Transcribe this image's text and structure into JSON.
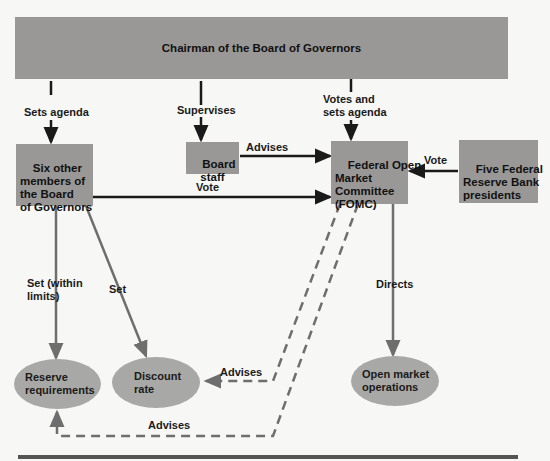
{
  "diagram": {
    "nodes": {
      "chairman": "Chairman of the Board of Governors",
      "six_members": "Six other\nmembers of\nthe Board\nof Governors",
      "board_staff": "Board\nstaff",
      "fomc": "Federal Open\nMarket\nCommittee\n(FOMC)",
      "five_presidents": "Five Federal\nReserve Bank\npresidents",
      "reserve_requirements": "Reserve\nrequirements",
      "discount_rate": "Discount\nrate",
      "open_market_operations": "Open market\noperations"
    },
    "edges": {
      "sets_agenda": "Sets agenda",
      "supervises": "Supervises",
      "votes_and_sets_agenda": "Votes and\nsets agenda",
      "board_staff_advises": "Advises",
      "six_members_vote": "Vote",
      "presidents_vote": "Vote",
      "set_within_limits": "Set (within\nlimits)",
      "set": "Set",
      "directs": "Directs",
      "fomc_advises_discount": "Advises",
      "fomc_advises_reserve": "Advises"
    },
    "colors": {
      "box": "#999896",
      "ellipse": "#a8a8a6",
      "line_dark": "#1a1a1a",
      "line_gray": "#6e6e6e",
      "background": "#f7f7f5"
    }
  }
}
